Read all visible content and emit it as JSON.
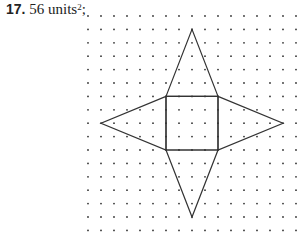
{
  "problem": {
    "number": "17.",
    "value": "56 units",
    "exponent": "2",
    "suffix": ";"
  },
  "figure": {
    "grid": {
      "cols": 17,
      "rows": 17,
      "origin_x": 88,
      "origin_y": 16,
      "dx": 13,
      "dy": 13.4,
      "dot_color": "#333333"
    },
    "square": [
      [
        6,
        6
      ],
      [
        10,
        6
      ],
      [
        10,
        10
      ],
      [
        6,
        10
      ]
    ],
    "triangles": [
      [
        [
          6,
          6
        ],
        [
          8,
          1
        ],
        [
          10,
          6
        ]
      ],
      [
        [
          6,
          10
        ],
        [
          8,
          15
        ],
        [
          10,
          10
        ]
      ],
      [
        [
          6,
          6
        ],
        [
          1,
          8
        ],
        [
          6,
          10
        ]
      ],
      [
        [
          10,
          6
        ],
        [
          15,
          8
        ],
        [
          10,
          10
        ]
      ]
    ],
    "line_color": "#333333"
  }
}
